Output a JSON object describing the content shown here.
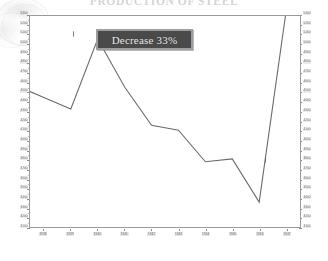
{
  "chart_data": {
    "type": "line",
    "title": "PRODUCTION OF STEEL",
    "xlabel": "",
    "ylabel": "",
    "grid": false,
    "legend_position": "none",
    "ylim": [
      3100,
      5300
    ],
    "y_ticks": [
      5300,
      5200,
      5100,
      5000,
      4900,
      4800,
      4700,
      4600,
      4500,
      4400,
      4300,
      4200,
      4100,
      4000,
      3900,
      3800,
      3700,
      3600,
      3500,
      3400,
      3300,
      3200,
      3100
    ],
    "y_axis_right_mirror": true,
    "categories": [
      "1938",
      "1939",
      "1940",
      "1941",
      "1942",
      "1943",
      "1944",
      "1945",
      "1946",
      "1947"
    ],
    "x": [
      1938,
      1939,
      1940,
      1941,
      1942,
      1943,
      1944,
      1945,
      1946,
      1947
    ],
    "series": [
      {
        "name": "Output",
        "values": [
          4450,
          4330,
          5060,
          4560,
          4160,
          4110,
          3780,
          3810,
          3360,
          5350
        ]
      }
    ],
    "annotations": [
      {
        "label": "Decrease 33%",
        "type": "callout-box"
      }
    ]
  },
  "callout": {
    "text": "Decrease 33%"
  },
  "axes": {
    "left_tick_labels": [
      "5300",
      "5200",
      "5100",
      "5000",
      "4900",
      "4800",
      "4700",
      "4600",
      "4500",
      "4400",
      "4300",
      "4200",
      "4100",
      "4000",
      "3900",
      "3800",
      "3700",
      "3600",
      "3500",
      "3400",
      "3300",
      "3200",
      "3100"
    ],
    "right_tick_labels": [
      "5300",
      "5200",
      "5100",
      "5000",
      "4900",
      "4800",
      "4700",
      "4600",
      "4500",
      "4400",
      "4300",
      "4200",
      "4100",
      "4000",
      "3900",
      "3800",
      "3700",
      "3600",
      "3500",
      "3400",
      "3300",
      "3200",
      "3100"
    ],
    "x_tick_labels": [
      "1938",
      "1939",
      "1940",
      "1941",
      "1942",
      "1943",
      "1944",
      "1945",
      "1946",
      "1947"
    ]
  },
  "colors": {
    "line": "#6b6b6b",
    "frame": "#9a9a9a",
    "callout_bg": "#4a4a4a",
    "callout_border": "#9e9e9e",
    "callout_text": "#f2f0ec",
    "tick_text": "#6d6d6d",
    "background": "#ffffff"
  }
}
